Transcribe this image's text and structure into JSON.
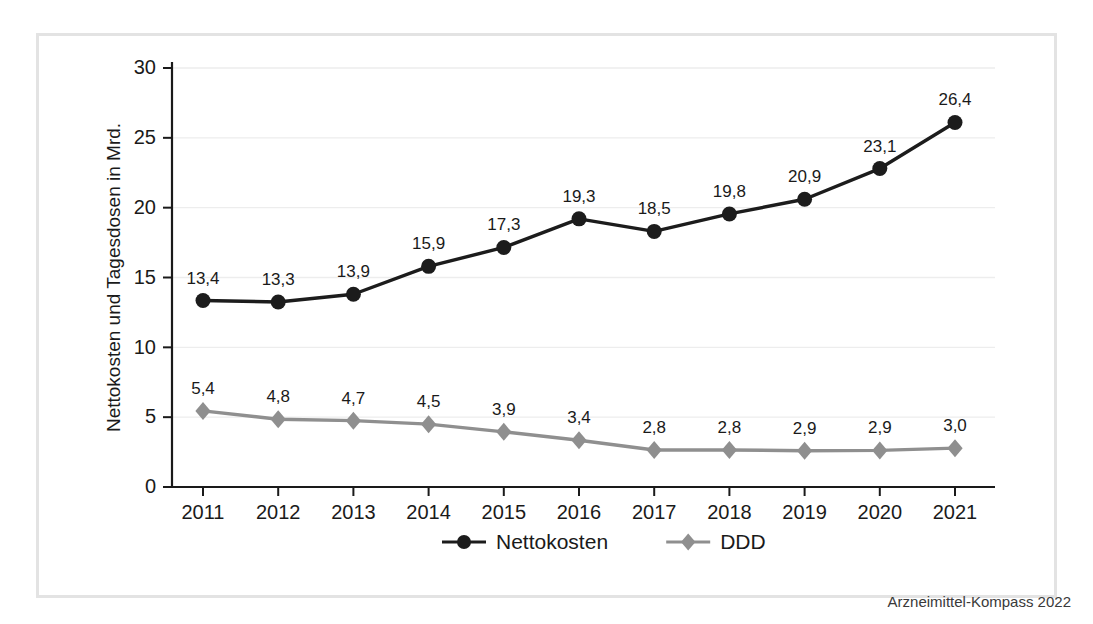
{
  "figure": {
    "source_credit": "Arzneimittel-Kompass 2022",
    "border_color": "#e3e3e3",
    "background": "#ffffff"
  },
  "chart_data": {
    "type": "line",
    "title": "",
    "xlabel": "",
    "ylabel": "Nettokosten und Tagesdosen in Mrd.",
    "categories": [
      "2011",
      "2012",
      "2013",
      "2014",
      "2015",
      "2016",
      "2017",
      "2018",
      "2019",
      "2020",
      "2021"
    ],
    "ylim": [
      0,
      30
    ],
    "yticks": [
      0,
      5,
      10,
      15,
      20,
      25,
      30
    ],
    "ytick_labels": [
      "0",
      "5",
      "10",
      "15",
      "20",
      "25",
      "30"
    ],
    "grid": true,
    "grid_axis": "y",
    "legend_position": "bottom-center",
    "series": [
      {
        "name": "Nettokosten",
        "color": "#1c1c1c",
        "marker": "circle",
        "values": [
          13.4,
          13.3,
          13.9,
          15.9,
          17.3,
          19.3,
          18.5,
          19.8,
          20.9,
          23.1,
          26.4
        ],
        "plotted": [
          13.35,
          13.25,
          13.8,
          15.8,
          17.15,
          19.2,
          18.3,
          19.55,
          20.6,
          22.8,
          26.1
        ],
        "labels": [
          "13,4",
          "13,3",
          "13,9",
          "15,9",
          "17,3",
          "19,3",
          "18,5",
          "19,8",
          "20,9",
          "23,1",
          "26,4"
        ]
      },
      {
        "name": "DDD",
        "color": "#8f8f8f",
        "marker": "diamond",
        "values": [
          5.4,
          4.8,
          4.7,
          4.5,
          3.9,
          3.4,
          2.8,
          2.8,
          2.9,
          2.9,
          3.0
        ],
        "plotted": [
          5.45,
          4.85,
          4.75,
          4.5,
          3.95,
          3.35,
          2.65,
          2.65,
          2.6,
          2.62,
          2.78
        ],
        "labels": [
          "5,4",
          "4,8",
          "4,7",
          "4,5",
          "3,9",
          "3,4",
          "2,8",
          "2,8",
          "2,9",
          "2,9",
          "3,0"
        ]
      }
    ]
  }
}
